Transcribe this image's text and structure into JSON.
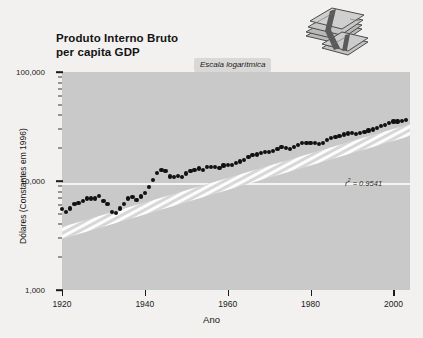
{
  "title": {
    "line1": "Produto Interno Bruto",
    "line2": "per capita GDP"
  },
  "badge": {
    "label": "Escala logarítmica"
  },
  "annotation": {
    "r2_prefix": "r",
    "r2_sup": "2",
    "r2_value": " = 0.9541",
    "r2_full": "r2 = 0.9541"
  },
  "decoration": {
    "money_icon": "money-stack-icon"
  },
  "colors": {
    "plot_background": "#c9c9c9",
    "page_background": "#f2f1ef",
    "point": "#111111",
    "gridline": "#f4f4f4",
    "trendline": "#ffffff",
    "badge_background": "#d9d8d6"
  },
  "chart_data": {
    "type": "scatter",
    "title": "Produto Interno Bruto per capita GDP",
    "subtitle": "Escala logarítmica",
    "xlabel": "Ano",
    "ylabel": "Dólares (Constantes em 1996)",
    "xlim": [
      1920,
      2004
    ],
    "ylim": [
      1000,
      100000
    ],
    "yscale": "log",
    "grid": true,
    "gridlines_y": [
      10000
    ],
    "legend": "none",
    "annotations": [
      {
        "text": "r2 = 0.9541",
        "x": 1981,
        "y": 38000
      }
    ],
    "xticks": [
      1920,
      1940,
      1960,
      1980,
      2000
    ],
    "xticklabels": [
      "1920",
      "1940",
      "1960",
      "1980",
      "2000"
    ],
    "yticks": [
      1000,
      10000,
      100000
    ],
    "yticklabels": [
      "1,000",
      "10,000",
      "100,000"
    ],
    "trendline": {
      "type": "exponential",
      "r_squared": 0.9541,
      "style": "white-hatched-band"
    },
    "x": [
      1920,
      1921,
      1922,
      1923,
      1924,
      1925,
      1926,
      1927,
      1928,
      1929,
      1930,
      1931,
      1932,
      1933,
      1934,
      1935,
      1936,
      1937,
      1938,
      1939,
      1940,
      1941,
      1942,
      1943,
      1944,
      1945,
      1946,
      1947,
      1948,
      1949,
      1950,
      1951,
      1952,
      1953,
      1954,
      1955,
      1956,
      1957,
      1958,
      1959,
      1960,
      1961,
      1962,
      1963,
      1964,
      1965,
      1966,
      1967,
      1968,
      1969,
      1970,
      1971,
      1972,
      1973,
      1974,
      1975,
      1976,
      1977,
      1978,
      1979,
      1980,
      1981,
      1982,
      1983,
      1984,
      1985,
      1986,
      1987,
      1988,
      1989,
      1990,
      1991,
      1992,
      1993,
      1994,
      1995,
      1996,
      1997,
      1998,
      1999,
      2000,
      2001,
      2002,
      2003
    ],
    "y": [
      5500,
      5200,
      5600,
      6200,
      6300,
      6600,
      6900,
      6900,
      6900,
      7300,
      6600,
      6100,
      5200,
      5100,
      5600,
      6200,
      6900,
      7100,
      6700,
      7200,
      7700,
      8800,
      10300,
      11900,
      12700,
      12400,
      11000,
      10800,
      11100,
      10900,
      11700,
      12400,
      12700,
      13000,
      12700,
      13400,
      13500,
      13500,
      13200,
      13900,
      14000,
      14100,
      14700,
      15100,
      15700,
      16500,
      17300,
      17500,
      18200,
      18600,
      18400,
      18800,
      19500,
      20400,
      20100,
      19800,
      20600,
      21300,
      22200,
      22500,
      22200,
      22500,
      21800,
      22500,
      23900,
      24600,
      25200,
      25900,
      26700,
      27300,
      27500,
      27100,
      27700,
      28200,
      29100,
      29700,
      30600,
      31700,
      32800,
      34000,
      35200,
      35100,
      35300,
      36000
    ]
  }
}
